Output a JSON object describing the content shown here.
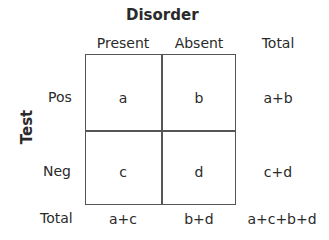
{
  "diagram": {
    "column_header": "Disorder",
    "row_header": "Test",
    "columns": [
      "Present",
      "Absent",
      "Total"
    ],
    "rows": [
      "Pos",
      "Neg",
      "Total"
    ],
    "cells": [
      [
        "a",
        "b",
        "a+b"
      ],
      [
        "c",
        "d",
        "c+d"
      ],
      [
        "a+c",
        "b+d",
        "a+c+b+d"
      ]
    ]
  }
}
